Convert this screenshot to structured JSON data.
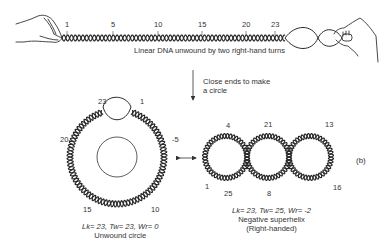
{
  "linear": {
    "caption": "Linear DNA unwound by two right-hand turns",
    "labels": [
      {
        "text": "1",
        "x": 65,
        "y": 24
      },
      {
        "text": "5",
        "x": 111,
        "y": 24
      },
      {
        "text": "10",
        "x": 154,
        "y": 24
      },
      {
        "text": "15",
        "x": 198,
        "y": 24
      },
      {
        "text": "20",
        "x": 243,
        "y": 24
      },
      {
        "text": "23",
        "x": 271,
        "y": 24
      }
    ]
  },
  "step": {
    "line1": "Close ends to make",
    "line2": "a circle"
  },
  "unwound_circle": {
    "formula": "Lk= 23, Tw= 23, Wr= 0",
    "caption": "Unwound circle",
    "labels": [
      {
        "text": "23",
        "x": 98,
        "y": 99
      },
      {
        "text": "1",
        "x": 140,
        "y": 99
      },
      {
        "text": "20-",
        "x": 60,
        "y": 136
      },
      {
        "text": "-5",
        "x": 173,
        "y": 136
      },
      {
        "text": "15",
        "x": 83,
        "y": 207
      },
      {
        "text": "10",
        "x": 152,
        "y": 207
      }
    ]
  },
  "supercoil": {
    "formula": "Lk= 23, Tw= 25, Wr= -2",
    "caption": "Negative superhelix",
    "subcaption": "(Right-handed)",
    "panel_label": "(b)",
    "labels": [
      {
        "text": "4",
        "x": 225,
        "y": 122
      },
      {
        "text": "21",
        "x": 264,
        "y": 121
      },
      {
        "text": "13",
        "x": 325,
        "y": 121
      },
      {
        "text": "1",
        "x": 206,
        "y": 184
      },
      {
        "text": "25",
        "x": 224,
        "y": 189
      },
      {
        "text": "8",
        "x": 267,
        "y": 189
      },
      {
        "text": "16",
        "x": 333,
        "y": 184
      }
    ]
  }
}
